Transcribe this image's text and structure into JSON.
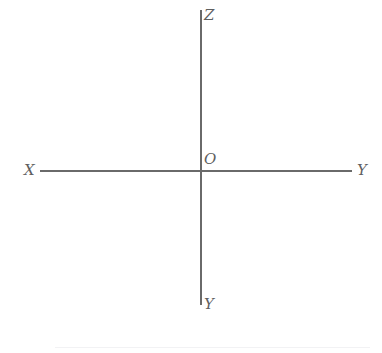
{
  "figure": {
    "background_color": "#ffffff",
    "axis_color": "#6a6a6a",
    "label_color": "#5f5f5f",
    "separator_color": "#f2f2f4",
    "width": 382,
    "height": 353
  },
  "labels": {
    "z_axis": "Z",
    "origin": "O",
    "x_axis": "X",
    "y_axis_positive": "Y",
    "y_axis_negative": "Y"
  },
  "chart_data": {
    "type": "line",
    "title": "",
    "subtitle": "",
    "xlabel": "",
    "ylabel": "",
    "grid": false,
    "legend": null,
    "axes": [
      {
        "name": "vertical-axis",
        "orientation": "vertical",
        "x": 201,
        "y_start": 10,
        "y_end": 305,
        "start_label": "Z",
        "end_label": "Y",
        "stroke": "#6a6a6a",
        "stroke_width": 1.5
      },
      {
        "name": "horizontal-axis",
        "orientation": "horizontal",
        "y": 171,
        "x_start": 40,
        "x_end": 352,
        "start_label": "X",
        "end_label": "Y",
        "stroke": "#6a6a6a",
        "stroke_width": 1.5
      }
    ],
    "points": [
      {
        "label": "O",
        "x": 201,
        "y": 171,
        "role": "origin"
      }
    ],
    "annotations": [
      {
        "text": "Z",
        "x": 204,
        "y": 8,
        "role": "axis-end-label"
      },
      {
        "text": "O",
        "x": 204,
        "y": 152,
        "role": "origin-label"
      },
      {
        "text": "X",
        "x": 24,
        "y": 163,
        "role": "axis-end-label"
      },
      {
        "text": "Y",
        "x": 357,
        "y": 163,
        "role": "axis-end-label"
      },
      {
        "text": "Y",
        "x": 204,
        "y": 297,
        "role": "axis-end-label"
      }
    ],
    "separator": {
      "y": 347,
      "x_start": 55,
      "x_end": 370,
      "stroke": "#f2f2f4"
    }
  }
}
